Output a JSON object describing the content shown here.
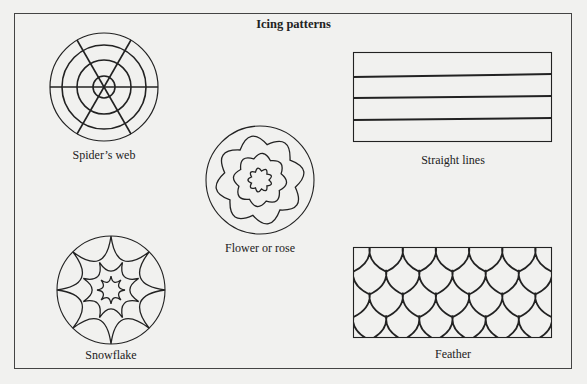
{
  "diagram": {
    "title": "Icing patterns",
    "patterns": [
      {
        "id": "spiders-web",
        "label": "Spider’s web",
        "shape": "circle",
        "rings": 4,
        "spokes": 6
      },
      {
        "id": "flower-or-rose",
        "label": "Flower or rose",
        "shape": "circle",
        "petal_layers": 3
      },
      {
        "id": "straight-lines",
        "label": "Straight lines",
        "shape": "rectangle",
        "inner_lines": 3
      },
      {
        "id": "snowflake",
        "label": "Snowflake",
        "shape": "circle",
        "star_layers": 3
      },
      {
        "id": "feather",
        "label": "Feather",
        "shape": "rectangle",
        "rows": 4
      }
    ],
    "colors": {
      "background": "#f1f1ef",
      "ink": "#222222"
    }
  }
}
